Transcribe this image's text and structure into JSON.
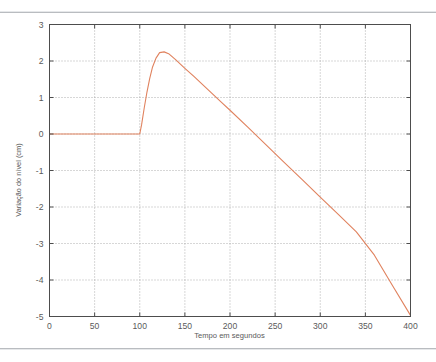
{
  "figure": {
    "top_rule": "",
    "bottom_rule": ""
  },
  "chart_data": {
    "type": "line",
    "title": "",
    "subtitle": "",
    "xlabel": "Tempo em segundos",
    "ylabel": "Variação do nível (cm)",
    "xlim": [
      0,
      400
    ],
    "ylim": [
      -5,
      3
    ],
    "xticks": [
      0,
      50,
      100,
      150,
      200,
      250,
      300,
      350,
      400
    ],
    "yticks": [
      3,
      2,
      1,
      0,
      -1,
      -2,
      -3,
      -4,
      -5
    ],
    "xtick_labels": [
      "0",
      "50",
      "100",
      "150",
      "200",
      "250",
      "300",
      "350",
      "400"
    ],
    "ytick_labels": [
      "3",
      "2",
      "1",
      "0",
      "-1",
      "-2",
      "-3",
      "-4",
      "-5"
    ],
    "grid": true,
    "grid_style": "dotted",
    "grid_color": "#9a9a9a",
    "frame_color": "#4d4d4d",
    "legend": null,
    "legend_position": "none",
    "series": [
      {
        "name": "Variação do nível",
        "color": "#e0825e",
        "line_width": 1.1,
        "x": [
          0,
          20,
          40,
          60,
          80,
          100,
          102,
          105,
          108,
          111,
          114,
          118,
          122,
          127,
          132,
          140,
          150,
          160,
          175,
          190,
          200,
          220,
          240,
          260,
          280,
          300,
          320,
          340,
          360,
          380,
          400
        ],
        "y": [
          0,
          0,
          0,
          0,
          0,
          0,
          0.25,
          0.72,
          1.15,
          1.52,
          1.82,
          2.08,
          2.23,
          2.25,
          2.2,
          2.03,
          1.8,
          1.58,
          1.23,
          0.88,
          0.65,
          0.18,
          -0.3,
          -0.78,
          -1.25,
          -1.73,
          -2.2,
          -2.68,
          -3.32,
          -4.15,
          -4.97
        ]
      }
    ],
    "annotations": []
  }
}
